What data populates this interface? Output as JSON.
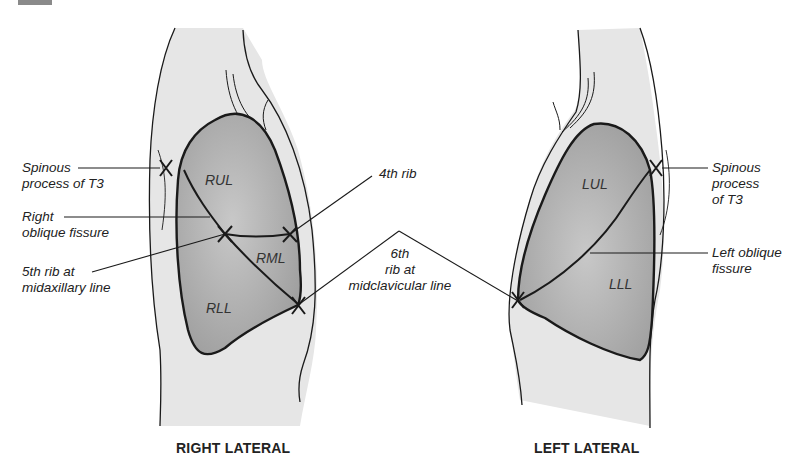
{
  "diagram": {
    "panels": [
      {
        "id": "right-lateral",
        "caption": "RIGHT LATERAL",
        "lobes": [
          "RUL",
          "RML",
          "RLL"
        ],
        "labels": {
          "spinous": [
            "Spinous",
            "process of T3"
          ],
          "fissure": [
            "Right",
            "oblique fissure"
          ],
          "rib5": [
            "5th rib at",
            "midaxillary line"
          ],
          "rib4": "4th rib"
        }
      },
      {
        "id": "left-lateral",
        "caption": "LEFT LATERAL",
        "lobes": [
          "LUL",
          "LLL"
        ],
        "labels": {
          "spinous": [
            "Spinous",
            "process",
            "of T3"
          ],
          "fissure": [
            "Left oblique",
            "fissure"
          ]
        }
      }
    ],
    "shared_label": [
      "6th",
      "rib at",
      "midclavicular line"
    ],
    "colors": {
      "body_fill": "#e6e6e6",
      "lung_fill": "#a9a9a9",
      "lung_fill_light": "#c4c4c4",
      "stroke": "#1a1a1a",
      "text": "#222222"
    }
  }
}
